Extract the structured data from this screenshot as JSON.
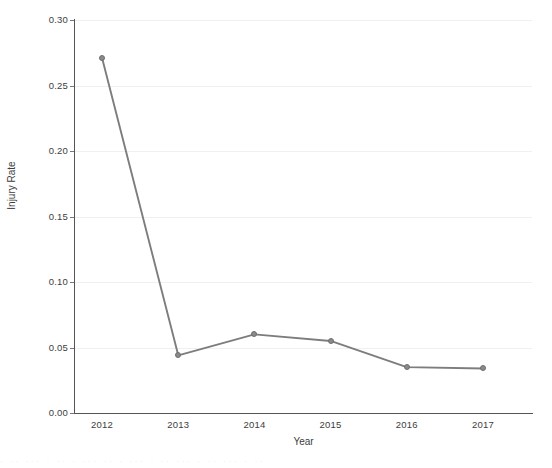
{
  "chart_data": {
    "type": "line",
    "title": "",
    "xlabel": "Year",
    "ylabel": "Injury Rate",
    "categories": [
      "2012",
      "2013",
      "2014",
      "2015",
      "2016",
      "2017"
    ],
    "values": [
      0.271,
      0.044,
      0.06,
      0.055,
      0.035,
      0.034
    ],
    "series": [
      {
        "name": "Injury Rate",
        "values": [
          0.271,
          0.044,
          0.06,
          0.055,
          0.035,
          0.034
        ]
      }
    ],
    "ylim": [
      0.0,
      0.3
    ],
    "ytick_labels": [
      "0.00",
      "0.05",
      "0.10",
      "0.15",
      "0.20",
      "0.25",
      "0.30"
    ],
    "ytick_values": [
      0.0,
      0.05,
      0.1,
      0.15,
      0.2,
      0.25,
      0.3
    ],
    "xtick_labels": [
      "2012",
      "2013",
      "2014",
      "2015",
      "2016",
      "2017"
    ],
    "grid": true,
    "grid_axis": "y",
    "legend": false,
    "legend_position": "none",
    "line_color": "#7d7d7d",
    "marker_color": "#8a8a8a",
    "axis_color": "#555555",
    "grid_color": "#f0f0f0",
    "background_color": "#ffffff",
    "marker_shape": "circle"
  },
  "artifact": {
    "bottom_text": "·  ··  ··· ·  ··  · ···  ·· ·  ···  · ·· ···  · ··  ··· ·  ··"
  }
}
